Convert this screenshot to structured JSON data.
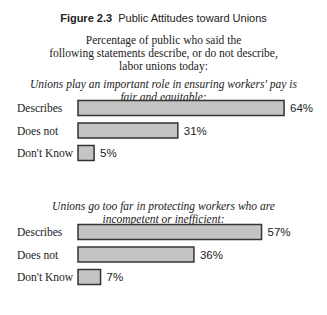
{
  "figure": {
    "label": "Figure 2.3",
    "title": "Public Attitudes toward Unions",
    "subtitle_lines": [
      "Percentage of public who said the",
      "following statements describe, or do not describe,",
      "labor unions today:"
    ]
  },
  "chart_data": [
    {
      "type": "bar",
      "orientation": "horizontal",
      "title_lines": [
        "Unions play an important role in ensuring workers' pay is",
        "fair and equitable:"
      ],
      "categories": [
        "Describes",
        "Does not",
        "Don't Know"
      ],
      "values": [
        64,
        31,
        5
      ],
      "value_labels": [
        "64%",
        "31%",
        "5%"
      ],
      "unit": "%",
      "xlim": [
        0,
        100
      ]
    },
    {
      "type": "bar",
      "orientation": "horizontal",
      "title_lines": [
        "Unions go too far in protecting workers who are",
        "incompetent or inefficient:"
      ],
      "categories": [
        "Describes",
        "Does not",
        "Don't Know"
      ],
      "values": [
        57,
        36,
        7
      ],
      "value_labels": [
        "57%",
        "36%",
        "7%"
      ],
      "unit": "%",
      "xlim": [
        0,
        100
      ]
    }
  ],
  "colors": {
    "bar_fill": "#c4c4c4",
    "bar_stroke": "#333333"
  }
}
